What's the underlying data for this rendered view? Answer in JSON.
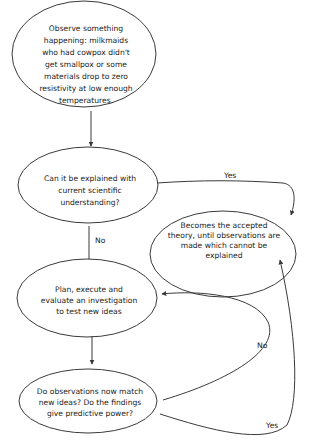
{
  "nodes": {
    "observe": {
      "lines": [
        "Observe something",
        "happening: milkmaids",
        "who had cowpox didn't",
        "get smallpox or some",
        "materials drop to zero",
        "resistivity at low enough",
        "temperatures."
      ]
    },
    "explain": {
      "lines": [
        "Can it be explained with",
        "current scientific",
        "understanding?"
      ]
    },
    "accepted": {
      "lines": [
        "Becomes the accepted",
        "theory, until observations are",
        "made which cannot be",
        "explained"
      ]
    },
    "plan": {
      "lines": [
        "Plan, execute and",
        "evaluate an investigation",
        "to test new ideas"
      ]
    },
    "match": {
      "lines": [
        "Do observations now match",
        "new ideas? Do the findings",
        "give predictive power?"
      ]
    }
  },
  "edges": {
    "explain_yes": "Yes",
    "explain_no": "No",
    "match_no": "No",
    "match_yes": "Yes"
  },
  "colors": {
    "stroke": "#3a3a3a",
    "text": "#222222",
    "background": "#ffffff"
  }
}
